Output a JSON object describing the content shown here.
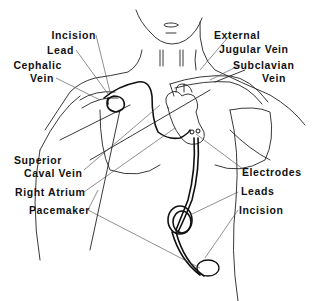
{
  "diagram": {
    "colors": {
      "line": "#222222",
      "lead": "#111111",
      "background": "#ffffff",
      "text": "#111111"
    },
    "labels": {
      "incision_top": "Incision",
      "lead": "Lead",
      "cephalic_line1": "Cephalic",
      "cephalic_line2": "Vein",
      "external_line1": "External",
      "external_line2": "Jugular Vein",
      "subclavian_line1": "Subclavian",
      "subclavian_line2": "Vein",
      "superior_line1": "Superior",
      "superior_line2": "Caval Vein",
      "right_atrium": "Right Atrium",
      "pacemaker": "Pacemaker",
      "electrodes": "Electrodes",
      "leads": "Leads",
      "incision_bottom": "Incision"
    }
  }
}
